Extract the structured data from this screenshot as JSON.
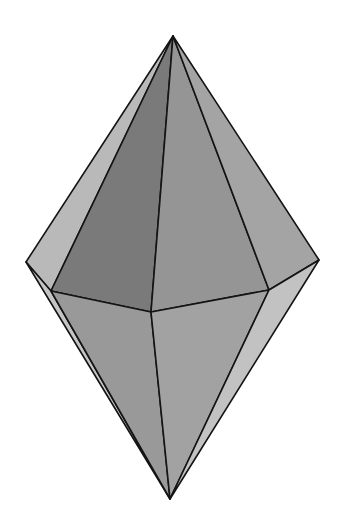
{
  "figure": {
    "shape": "hexagonal bipyramid",
    "background_color": "#ffffff",
    "edge_color": "#141414",
    "vertices": {
      "top_apex": [
        173,
        36
      ],
      "left": [
        26,
        262
      ],
      "right": [
        319,
        260
      ],
      "front_left": [
        51,
        291
      ],
      "front_center": [
        151,
        312
      ],
      "front_right": [
        269,
        290
      ],
      "bottom_apex": [
        170,
        499
      ]
    },
    "faces": [
      {
        "id": "upper-left-back",
        "points": "173,36 26,262 51,291",
        "fill": "#b9b9b9"
      },
      {
        "id": "upper-front-left",
        "points": "173,36 51,291 151,312",
        "fill": "#7a7a7a"
      },
      {
        "id": "upper-front-right",
        "points": "173,36 151,312 269,290",
        "fill": "#959595"
      },
      {
        "id": "upper-right",
        "points": "173,36 269,290 319,260",
        "fill": "#a4a4a4"
      },
      {
        "id": "lower-left-back",
        "points": "26,262 51,291 170,499",
        "fill": "#c4c4c4"
      },
      {
        "id": "lower-front-left",
        "points": "51,291 151,312 170,499",
        "fill": "#999999"
      },
      {
        "id": "lower-front-right",
        "points": "151,312 269,290 170,499",
        "fill": "#a2a2a2"
      },
      {
        "id": "lower-right",
        "points": "269,290 319,260 170,499",
        "fill": "#c2c2c2"
      }
    ]
  }
}
